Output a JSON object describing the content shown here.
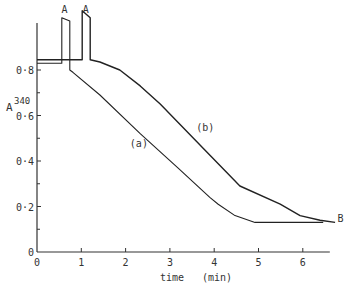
{
  "chart_data": {
    "type": "line",
    "title": "",
    "xlabel": "time   (min)",
    "ylabel": "A",
    "ylabel_superscript": "340",
    "xlim": [
      0,
      6.7
    ],
    "ylim": [
      0,
      0.95
    ],
    "x_ticks": [
      0,
      1,
      2,
      3,
      4,
      5,
      6
    ],
    "x_tick_labels": [
      "0",
      "1",
      "2",
      "3",
      "4",
      "5",
      "6"
    ],
    "y_ticks": [
      0,
      0.2,
      0.4,
      0.6,
      0.8
    ],
    "y_tick_labels": [
      "0",
      "0·2",
      "0·4",
      "0·6",
      "0·8"
    ],
    "y_minor_ticks": [
      0.1,
      0.3,
      0.5,
      0.7
    ],
    "grid": false,
    "series": [
      {
        "name": "(a)",
        "x": [
          0,
          0.56,
          0.56,
          0.74,
          0.74,
          0.81,
          1.42,
          2.33,
          3.18,
          3.9,
          4.09,
          4.47,
          4.92,
          6.46
        ],
        "y": [
          0.83,
          0.83,
          1.03,
          1.015,
          0.8,
          0.79,
          0.69,
          0.52,
          0.37,
          0.24,
          0.21,
          0.16,
          0.13,
          0.13
        ]
      },
      {
        "name": "(b)",
        "x": [
          0,
          1.02,
          1.02,
          1.2,
          1.2,
          1.42,
          1.87,
          2.33,
          2.78,
          3.68,
          4.58,
          5.49,
          5.94,
          6.39,
          6.73
        ],
        "y": [
          0.845,
          0.845,
          1.06,
          1.03,
          0.845,
          0.835,
          0.8,
          0.73,
          0.65,
          0.47,
          0.29,
          0.21,
          0.16,
          0.14,
          0.13
        ]
      }
    ],
    "annotations": [
      {
        "text": "A",
        "x": 0.62,
        "y": 1.05,
        "meaning": "addition point curve (a)"
      },
      {
        "text": "A",
        "x": 1.1,
        "y": 1.05,
        "meaning": "addition point curve (b)"
      },
      {
        "text": "(a)",
        "x": 2.3,
        "y": 0.46
      },
      {
        "text": "(b)",
        "x": 3.8,
        "y": 0.53
      },
      {
        "text": "B",
        "x": 6.85,
        "y": 0.13
      }
    ]
  }
}
